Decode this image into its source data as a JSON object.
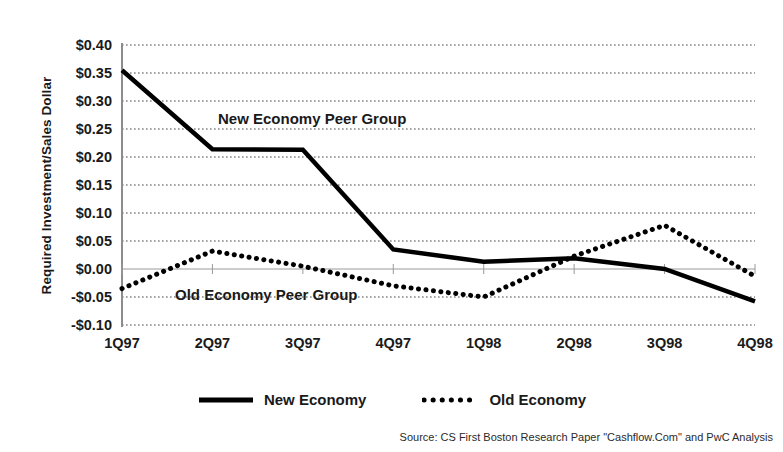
{
  "chart_data": {
    "type": "line",
    "title": "",
    "xlabel": "",
    "ylabel": "Required Investment/Sales Dollar",
    "categories": [
      "1Q97",
      "2Q97",
      "3Q97",
      "4Q97",
      "1Q98",
      "2Q98",
      "3Q98",
      "4Q98"
    ],
    "ylim": [
      -0.1,
      0.4
    ],
    "ytick_values": [
      0.4,
      0.35,
      0.3,
      0.25,
      0.2,
      0.15,
      0.1,
      0.05,
      0.0,
      -0.05,
      -0.1
    ],
    "ytick_labels": [
      "$0.40",
      "$0.35",
      "$0.30",
      "$0.25",
      "$0.20",
      "$0.15",
      "$0.10",
      "$0.05",
      "$0.00",
      "-$0.05",
      "-$0.10"
    ],
    "grid": true,
    "grid_style": "dotted",
    "zero_line": true,
    "legend_position": "bottom-center",
    "series": [
      {
        "name": "New Economy",
        "style": "solid",
        "color": "#000000",
        "width": 4.5,
        "values": [
          0.355,
          0.214,
          0.213,
          0.035,
          0.013,
          0.019,
          0.0,
          -0.058
        ]
      },
      {
        "name": "Old Economy",
        "style": "dotted",
        "color": "#000000",
        "width": 4.5,
        "values": [
          -0.035,
          0.032,
          0.005,
          -0.03,
          -0.05,
          0.023,
          0.078,
          -0.013
        ]
      }
    ],
    "annotations": [
      {
        "text": "New Economy Peer Group",
        "series": "New Economy"
      },
      {
        "text": "Old Economy Peer Group",
        "series": "Old Economy"
      }
    ]
  },
  "legend": {
    "items": [
      {
        "label": "New Economy",
        "style": "solid"
      },
      {
        "label": "Old Economy",
        "style": "dotted"
      }
    ]
  },
  "footer": {
    "source": "Source: CS First Boston Research Paper \"Cashflow.Com\" and PwC Analysis"
  }
}
